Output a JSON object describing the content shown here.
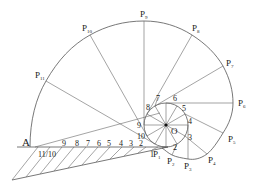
{
  "diagram": {
    "colors": {
      "line": "#555555",
      "text": "#222222",
      "background": "#ffffff"
    },
    "center": {
      "label": "O",
      "x": 166,
      "y": 125
    },
    "circle_radius": 22,
    "start_point": {
      "label": "A",
      "x": 30,
      "y": 147
    },
    "baseline": {
      "y": 147,
      "x1": 17,
      "x2": 168
    },
    "involute_points": [
      {
        "label": "P",
        "sub": "1",
        "x": 162,
        "y": 148
      },
      {
        "label": "P",
        "sub": "2",
        "x": 172,
        "y": 155
      },
      {
        "label": "P",
        "sub": "3",
        "x": 188,
        "y": 159
      },
      {
        "label": "P",
        "sub": "4",
        "x": 207,
        "y": 154
      },
      {
        "label": "P",
        "sub": "5",
        "x": 223,
        "y": 133
      },
      {
        "label": "P",
        "sub": "6",
        "x": 233,
        "y": 103
      },
      {
        "label": "P",
        "sub": "7",
        "x": 223,
        "y": 66
      },
      {
        "label": "P",
        "sub": "8",
        "x": 192,
        "y": 35
      },
      {
        "label": "P",
        "sub": "9",
        "x": 144,
        "y": 21
      },
      {
        "label": "P",
        "sub": "10",
        "x": 90,
        "y": 35
      },
      {
        "label": "P",
        "sub": "11",
        "x": 46,
        "y": 81
      }
    ],
    "circle_division_labels": [
      "1",
      "2",
      "3",
      "4",
      "5",
      "6",
      "7",
      "8",
      "9",
      "10"
    ],
    "baseline_division_labels": [
      "11/10",
      "9",
      "8",
      "7",
      "6",
      "5",
      "4",
      "3",
      "2",
      "1"
    ]
  }
}
